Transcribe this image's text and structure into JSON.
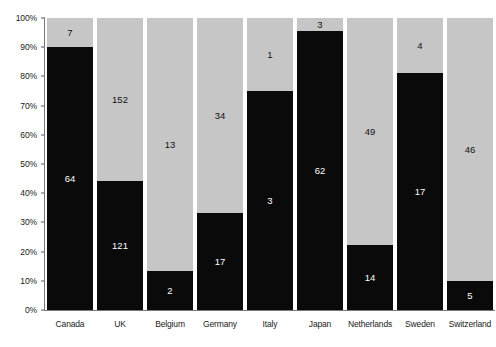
{
  "chart_data": {
    "type": "bar",
    "subtype": "stacked-percent",
    "title": "",
    "subtitle": "",
    "xlabel": "",
    "ylabel": "",
    "ylim": [
      0,
      100
    ],
    "grid": false,
    "legend": "none",
    "categories": [
      "Canada",
      "UK",
      "Belgium",
      "Germany",
      "Italy",
      "Japan",
      "Netherlands",
      "Sweden",
      "Switzerland"
    ],
    "series": [
      {
        "name": "black",
        "color": "#0a0a0a",
        "values": [
          64,
          121,
          2,
          17,
          3,
          62,
          14,
          17,
          5
        ],
        "percents": [
          90.1,
          44.3,
          13.3,
          33.3,
          75.0,
          95.4,
          22.2,
          81.0,
          9.8
        ]
      },
      {
        "name": "grey",
        "color": "#c6c6c6",
        "values": [
          7,
          152,
          13,
          34,
          1,
          3,
          49,
          4,
          46
        ],
        "percents": [
          9.9,
          55.7,
          86.7,
          66.7,
          25.0,
          4.6,
          77.8,
          19.0,
          90.2
        ]
      }
    ],
    "y_ticks": [
      "0%",
      "10%",
      "20%",
      "30%",
      "40%",
      "50%",
      "60%",
      "70%",
      "80%",
      "90%",
      "100%"
    ],
    "y_tick_values": [
      0,
      10,
      20,
      30,
      40,
      50,
      60,
      70,
      80,
      90,
      100
    ]
  },
  "axis": {
    "y_label_0": "0%",
    "y_label_10": "10%",
    "y_label_20": "20%",
    "y_label_30": "30%",
    "y_label_40": "40%",
    "y_label_50": "50%",
    "y_label_60": "60%",
    "y_label_70": "70%",
    "y_label_80": "80%",
    "y_label_90": "90%",
    "y_label_100": "100%"
  },
  "colors": {
    "black_segment": "#0a0a0a",
    "grey_segment": "#c6c6c6",
    "background": "#ffffff",
    "axis": "#777777",
    "text": "#1a1a1a"
  }
}
